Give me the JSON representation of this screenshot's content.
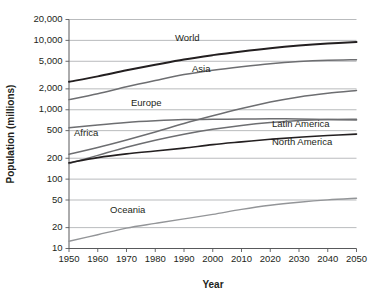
{
  "chart_data": {
    "type": "line",
    "title": "",
    "xlabel": "Year",
    "ylabel": "Population (millions)",
    "yscale": "log",
    "xlim": [
      1950,
      2050
    ],
    "ylim": [
      10,
      20000
    ],
    "grid": true,
    "legend_position": "inline-labels",
    "ytick_labels": [
      "20,000",
      "10,000",
      "5,000",
      "2,000",
      "1,000",
      "500",
      "200",
      "100",
      "50",
      "20",
      "10"
    ],
    "ytick_values": [
      20000,
      10000,
      5000,
      2000,
      1000,
      500,
      200,
      100,
      50,
      20,
      10
    ],
    "xtick_labels": [
      "1950",
      "1960",
      "1970",
      "1980",
      "1990",
      "2000",
      "2010",
      "2020",
      "2030",
      "2040",
      "2050"
    ],
    "x": [
      1950,
      1960,
      1970,
      1980,
      1990,
      2000,
      2010,
      2020,
      2030,
      2040,
      2050
    ],
    "series": [
      {
        "name": "World",
        "color": "#231f20",
        "width": 2.0,
        "label_x": 175,
        "label_y": 41,
        "values": [
          2530,
          3030,
          3700,
          4450,
          5320,
          6130,
          6930,
          7720,
          8420,
          9000,
          9450
        ]
      },
      {
        "name": "Asia",
        "color": "#6d6e71",
        "width": 1.5,
        "label_x": 192,
        "label_y": 72,
        "values": [
          1400,
          1700,
          2140,
          2640,
          3220,
          3720,
          4180,
          4620,
          4950,
          5160,
          5260
        ]
      },
      {
        "name": "Africa",
        "color": "#6d6e71",
        "width": 1.5,
        "label_x": 74,
        "label_y": 136,
        "values": [
          228,
          285,
          366,
          478,
          634,
          819,
          1040,
          1290,
          1530,
          1730,
          1900
        ]
      },
      {
        "name": "Europe",
        "color": "#6d6e71",
        "width": 1.5,
        "label_x": 131,
        "label_y": 106,
        "values": [
          549,
          605,
          657,
          694,
          721,
          727,
          735,
          740,
          736,
          725,
          710
        ]
      },
      {
        "name": "Latin America",
        "color": "#6d6e71",
        "width": 1.5,
        "label_x": 272,
        "label_y": 127,
        "values": [
          168,
          220,
          288,
          364,
          445,
          524,
          594,
          654,
          700,
          725,
          730
        ]
      },
      {
        "name": "North America",
        "color": "#231f20",
        "width": 1.6,
        "label_x": 272,
        "label_y": 145,
        "values": [
          172,
          204,
          231,
          254,
          280,
          314,
          344,
          375,
          402,
          425,
          446
        ]
      },
      {
        "name": "Oceania",
        "color": "#939598",
        "width": 1.4,
        "label_x": 110,
        "label_y": 213,
        "values": [
          12.7,
          15.8,
          19.7,
          23.0,
          26.7,
          31.0,
          36.6,
          42.0,
          46.5,
          50.3,
          53.0
        ]
      }
    ]
  }
}
